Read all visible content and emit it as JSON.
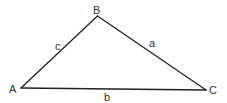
{
  "diagram": {
    "type": "triangle",
    "vertices": [
      {
        "label": "A",
        "x": 21,
        "y": 88
      },
      {
        "label": "B",
        "x": 97.5,
        "y": 16
      },
      {
        "label": "C",
        "x": 206,
        "y": 90
      }
    ],
    "sides": [
      {
        "label": "a",
        "from": "B",
        "to": "C"
      },
      {
        "label": "b",
        "from": "A",
        "to": "C"
      },
      {
        "label": "c",
        "from": "A",
        "to": "B"
      }
    ],
    "colors": {
      "stroke": "#222222",
      "text": "#333333",
      "background": "#ffffff"
    }
  },
  "labels": {
    "vertex_a": "A",
    "vertex_b": "B",
    "vertex_c": "C",
    "side_a": "a",
    "side_b": "b",
    "side_c": "c"
  }
}
